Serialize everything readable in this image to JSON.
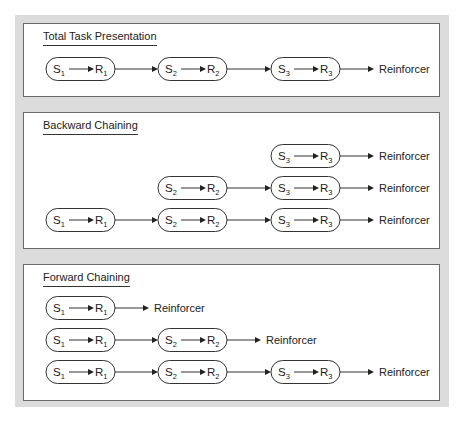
{
  "colors": {
    "backdrop": "#dcdcdc",
    "panel_border": "#6a6a6a",
    "line": "#333333",
    "text": "#222222"
  },
  "panels": [
    {
      "title": "Total Task Presentation",
      "rows": [
        {
          "steps": [
            "1",
            "2",
            "3"
          ],
          "start_col": 0,
          "end": "Reinforcer"
        }
      ]
    },
    {
      "title": "Backward Chaining",
      "rows": [
        {
          "steps": [
            "3"
          ],
          "start_col": 2,
          "end": "Reinforcer"
        },
        {
          "steps": [
            "2",
            "3"
          ],
          "start_col": 1,
          "end": "Reinforcer"
        },
        {
          "steps": [
            "1",
            "2",
            "3"
          ],
          "start_col": 0,
          "end": "Reinforcer"
        }
      ]
    },
    {
      "title": "Forward Chaining",
      "rows": [
        {
          "steps": [
            "1"
          ],
          "start_col": 0,
          "end": "Reinforcer"
        },
        {
          "steps": [
            "1",
            "2"
          ],
          "start_col": 0,
          "end": "Reinforcer"
        },
        {
          "steps": [
            "1",
            "2",
            "3"
          ],
          "start_col": 0,
          "end": "Reinforcer"
        }
      ]
    }
  ],
  "labels": {
    "stimulus": "S",
    "response": "R"
  }
}
